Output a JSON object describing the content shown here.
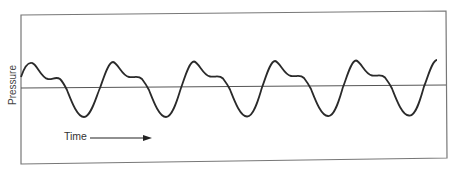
{
  "figure": {
    "ylabel": "Pressure",
    "time_label": "Time",
    "colors": {
      "frame": "#777777",
      "curve": "#2a2a2a",
      "baseline": "#555555",
      "text": "#333333"
    }
  },
  "chart_data": {
    "type": "line",
    "title": "",
    "xlabel": "Time",
    "ylabel": "Pressure",
    "grid": false,
    "legend": null,
    "annotations": [
      "Time arrow pointing right beneath the curve"
    ],
    "x": [
      0,
      11,
      27,
      38,
      45,
      63,
      79,
      92
    ],
    "y": [
      0.4,
      0.9,
      0.3,
      0.35,
      0,
      -1.0,
      0,
      0.95
    ],
    "units": "relative (0 = mean baseline)",
    "period_px": 81,
    "cycles_shown": 5.3
  }
}
